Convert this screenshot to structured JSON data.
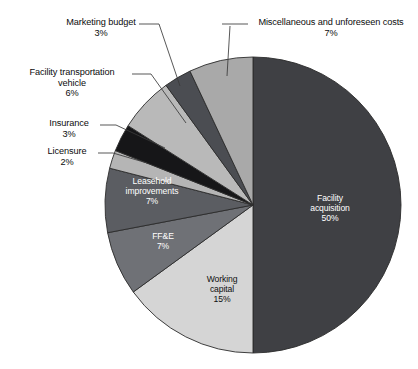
{
  "chart_data": {
    "type": "pie",
    "title": "",
    "subtitle": "",
    "xlabel": "",
    "ylabel": "",
    "legend_position": "none",
    "grid": false,
    "units": "percent",
    "total": 100,
    "start_angle_deg": 0,
    "direction": "clockwise",
    "categories": [
      "Facility acquisition",
      "Working capital",
      "FF&E",
      "Leasehold improvements",
      "Licensure",
      "Insurance",
      "Facility transportation vehicle",
      "Marketing budget",
      "Miscellaneous and unforeseen costs"
    ],
    "values": [
      50,
      15,
      7,
      7,
      2,
      3,
      6,
      3,
      7
    ],
    "slices": [
      {
        "id": "facility-acquisition",
        "label": "Facility acquisition",
        "label_line1": "Facility",
        "label_line2": "acquisition",
        "value": 50,
        "percent_text": "50%",
        "color": "#3f4044",
        "label_placement": "inside",
        "text_color": "#ffffff"
      },
      {
        "id": "working-capital",
        "label": "Working capital",
        "label_line1": "Working",
        "label_line2": "capital",
        "value": 15,
        "percent_text": "15%",
        "color": "#d5d5d5",
        "label_placement": "inside",
        "text_color": "#101010"
      },
      {
        "id": "ffe",
        "label": "FF&E",
        "label_line1": "FF&E",
        "label_line2": "",
        "value": 7,
        "percent_text": "7%",
        "color": "#6f7176",
        "label_placement": "inside",
        "text_color": "#ffffff"
      },
      {
        "id": "leasehold-improvements",
        "label": "Leasehold improvements",
        "label_line1": "Leasehold",
        "label_line2": "improvements",
        "value": 7,
        "percent_text": "7%",
        "color": "#5b5d62",
        "label_placement": "inside",
        "text_color": "#ffffff"
      },
      {
        "id": "licensure",
        "label": "Licensure",
        "value": 2,
        "percent_text": "2%",
        "color": "#b5b5b5",
        "label_placement": "outside",
        "text_color": "#0c0c0c"
      },
      {
        "id": "insurance",
        "label": "Insurance",
        "value": 3,
        "percent_text": "3%",
        "color": "#161618",
        "label_placement": "outside",
        "text_color": "#0c0c0c"
      },
      {
        "id": "facility-transportation-vehicle",
        "label": "Facility transportation vehicle",
        "label_line1": "Facility transportation",
        "label_line2": "vehicle",
        "value": 6,
        "percent_text": "6%",
        "color": "#b9b9b9",
        "label_placement": "outside",
        "text_color": "#0c0c0c"
      },
      {
        "id": "marketing-budget",
        "label": "Marketing budget",
        "value": 3,
        "percent_text": "3%",
        "color": "#4b4d52",
        "label_placement": "outside",
        "text_color": "#0c0c0c"
      },
      {
        "id": "miscellaneous-and-unforeseen-costs",
        "label": "Miscellaneous and unforeseen costs",
        "value": 7,
        "percent_text": "7%",
        "color": "#a9a9a9",
        "label_placement": "outside",
        "text_color": "#0c0c0c"
      }
    ]
  },
  "labels": {
    "marketing_budget": {
      "line1": "Marketing budget",
      "line2": "3%"
    },
    "miscellaneous": {
      "line1": "Miscellaneous and unforeseen costs",
      "line2": "7%"
    },
    "facility_transportation": {
      "line1": "Facility transportation",
      "line2": "vehicle",
      "line3": "6%"
    },
    "insurance": {
      "line1": "Insurance",
      "line2": "3%"
    },
    "licensure": {
      "line1": "Licensure",
      "line2": "2%"
    },
    "leasehold": {
      "line1": "Leasehold",
      "line2": "improvements",
      "line3": "7%"
    },
    "ffe": {
      "line1": "FF&E",
      "line2": "7%"
    },
    "working_capital": {
      "line1": "Working",
      "line2": "capital",
      "line3": "15%"
    },
    "facility_acquisition": {
      "line1": "Facility",
      "line2": "acquisition",
      "line3": "50%"
    }
  },
  "style": {
    "background": "#ffffff",
    "stroke": "#2b2b2b",
    "leader_line_color": "#3a3a3a"
  }
}
